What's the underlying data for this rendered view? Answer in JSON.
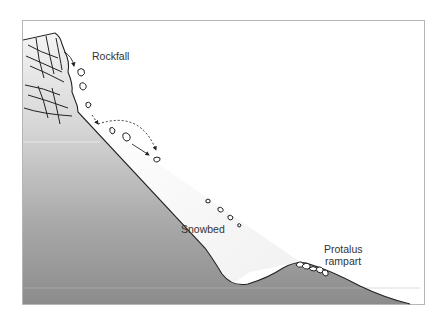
{
  "diagram": {
    "type": "cross-section",
    "labels": {
      "rockfall": "Rockfall",
      "snowbed": "Snowbed",
      "protalus_line1": "Protalus",
      "protalus_line2": "rampart"
    },
    "colors": {
      "frame": "#b0b0b0",
      "ground_top": "#f2f2f2",
      "ground_bottom": "#8a8a8a",
      "snowbed": "#f4f4f4",
      "outline": "#222222",
      "rock_fill": "#ffffff"
    },
    "elements": [
      {
        "name": "bedrock-cliff",
        "desc": "Jointed rock face with crossing fracture lines"
      },
      {
        "name": "slope",
        "desc": "Straight hillslope below the cliff"
      },
      {
        "name": "snowbed",
        "desc": "Wedge of snow resting on the lower slope"
      },
      {
        "name": "falling-rocks",
        "desc": "Clasts falling from the cliff and sliding across the snowbed"
      },
      {
        "name": "bounce-trajectory",
        "desc": "Dashed arc showing a clast bouncing onto the snow"
      },
      {
        "name": "protalus-rampart",
        "desc": "Ridge of accumulated boulders at the foot of the snowbed"
      }
    ]
  }
}
